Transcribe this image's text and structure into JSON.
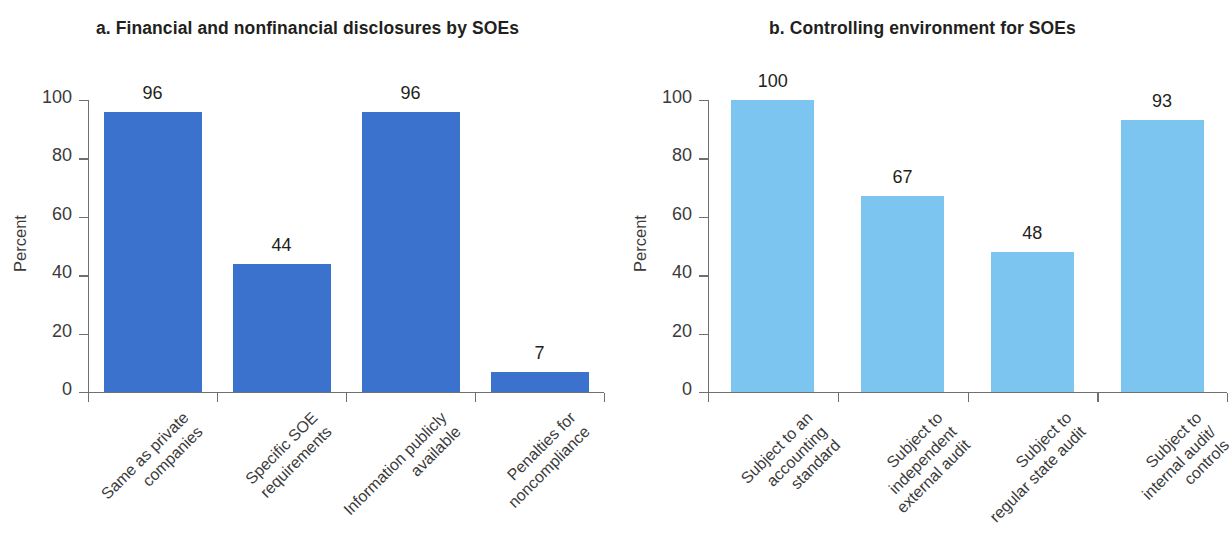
{
  "chart_data": [
    {
      "type": "bar",
      "panel": "a",
      "title": "a. Financial and nonfinancial disclosures by SOEs",
      "categories": [
        "Same as private\ncompanies",
        "Specific SOE\nrequirements",
        "Information publicly\navailable",
        "Penalties for\nnoncompliance"
      ],
      "values": [
        96,
        44,
        96,
        7
      ],
      "value_labels": [
        "96",
        "44",
        "96",
        "7"
      ],
      "xlabel": "",
      "ylabel": "Percent",
      "ylim": [
        0,
        100
      ],
      "yticks": [
        0,
        20,
        40,
        60,
        80,
        100
      ],
      "ytick_labels": [
        "0",
        "20",
        "40",
        "60",
        "80",
        "100"
      ],
      "grid": false,
      "legend": false,
      "bar_color": "#3b72ce"
    },
    {
      "type": "bar",
      "panel": "b",
      "title": "b. Controlling environment for SOEs",
      "categories": [
        "Subject to an\naccounting\nstandard",
        "Subject to\nindependent\nexternal audit",
        "Subject to\nregular state audit",
        "Subject to\ninternal audit/\ncontrols"
      ],
      "values": [
        100,
        67,
        48,
        93
      ],
      "value_labels": [
        "100",
        "67",
        "48",
        "93"
      ],
      "xlabel": "",
      "ylabel": "Percent",
      "ylim": [
        0,
        100
      ],
      "yticks": [
        0,
        20,
        40,
        60,
        80,
        100
      ],
      "ytick_labels": [
        "0",
        "20",
        "40",
        "60",
        "80",
        "100"
      ],
      "grid": false,
      "legend": false,
      "bar_color": "#7cc5f0"
    }
  ]
}
